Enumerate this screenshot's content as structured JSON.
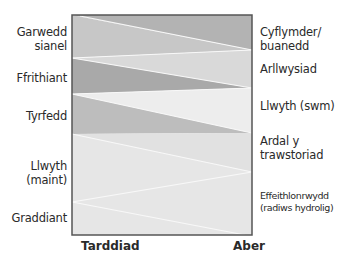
{
  "diagram": {
    "type": "wedge-comparison",
    "left_labels": [
      {
        "text_lines": [
          "Garwedd",
          "sianel"
        ]
      },
      {
        "text_lines": [
          "Ffrithiant"
        ]
      },
      {
        "text_lines": [
          "Tyrfedd"
        ]
      },
      {
        "text_lines": [
          "Llwyth",
          "(maint)"
        ]
      },
      {
        "text_lines": [
          "Graddiant"
        ]
      }
    ],
    "right_labels": [
      {
        "text_lines": [
          "Cyflymder/",
          "buanedd"
        ]
      },
      {
        "text_lines": [
          "Arllwysiad"
        ]
      },
      {
        "text_lines": [
          "Llwyth (swm)"
        ]
      },
      {
        "text_lines": [
          "Ardal y",
          "trawstoriad"
        ]
      },
      {
        "text_lines": [
          "Effeithlonrwydd",
          "(radiws hydrolig)"
        ]
      }
    ],
    "axis": {
      "left": "Tarddiad",
      "right": "Aber"
    },
    "colors": {
      "frame": "#555555",
      "band_top_dark": "#b3b3b3",
      "band_top_light": "#c7c7c7",
      "band_light": "#d9d9d9",
      "band_dark": "#a9a9a9",
      "band_very_light": "#ededed",
      "band_mid": "#bdbdbd",
      "band_bottom": "#e6e6e6",
      "divider": "#f8f8f8"
    }
  }
}
